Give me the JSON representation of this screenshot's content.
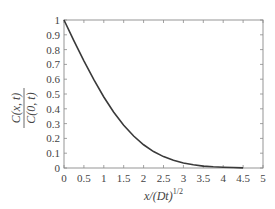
{
  "chart_data": {
    "type": "line",
    "title": "",
    "xlabel": "x/(Dt)^1/2",
    "ylabel": "C(x, t) / C(0, t)",
    "xlabel_parts": {
      "main": "x/(Dt)",
      "sup": "1/2"
    },
    "ylabel_parts": {
      "numerator": "C(x, t)",
      "denominator": "C(0, t)"
    },
    "xlim": [
      0,
      5
    ],
    "ylim": [
      0,
      1
    ],
    "xticks": [
      "0",
      "0.5",
      "1",
      "1.5",
      "2",
      "2.5",
      "3",
      "3.5",
      "4",
      "4.5",
      "5"
    ],
    "yticks": [
      "0",
      "0.1",
      "0.2",
      "0.3",
      "0.4",
      "0.5",
      "0.6",
      "0.7",
      "0.8",
      "0.9",
      "1"
    ],
    "grid": false,
    "legend": null,
    "series": [
      {
        "name": "erfc(x / 2(Dt)^1/2)",
        "color": "#3a3a3a",
        "x": [
          0,
          0.25,
          0.5,
          0.75,
          1.0,
          1.25,
          1.5,
          1.75,
          2.0,
          2.25,
          2.5,
          2.75,
          3.0,
          3.25,
          3.5,
          3.75,
          4.0,
          4.25,
          4.5
        ],
        "y": [
          1.0,
          0.859,
          0.724,
          0.597,
          0.48,
          0.377,
          0.289,
          0.216,
          0.157,
          0.111,
          0.077,
          0.052,
          0.034,
          0.022,
          0.013,
          0.008,
          0.005,
          0.003,
          0.001
        ]
      }
    ]
  },
  "colors": {
    "axis": "#8a8a8a",
    "line": "#3a3a3a",
    "text": "#444444"
  }
}
